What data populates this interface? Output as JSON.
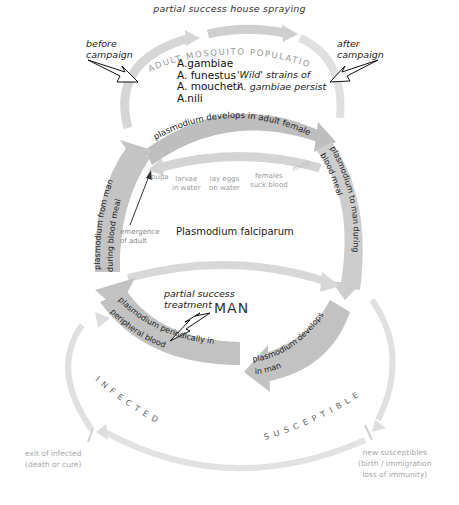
{
  "diagram": {
    "top_label": "partial success house spraying",
    "before_campaign": [
      "before",
      "campaign"
    ],
    "after_campaign": [
      "after",
      "campaign"
    ],
    "mosquito_population_label": "ADULT MOSQUITO POPULATION",
    "species": [
      "A.gambiae",
      "A. funestus",
      "A. moucheti",
      "A.nili"
    ],
    "wild_strains": [
      "'Wild' strains of",
      "A. gambiae persist"
    ],
    "arrow_plasmodium_adult_female": "plasmodium develops in adult female",
    "mosquito_life_cycle": {
      "pupa": "pupa",
      "larvae": [
        "larvae",
        "in water"
      ],
      "lay_eggs": [
        "lay eggs",
        "on water"
      ],
      "females": [
        "females",
        "suck blood"
      ],
      "mate": "mate"
    },
    "emergence": [
      "emergence",
      "of adult"
    ],
    "arrow_from_man": [
      "plasmodium from man",
      "during  blood meal"
    ],
    "arrow_to_man": [
      "plasmodium to man during",
      "blood meal"
    ],
    "center_label": "Plasmodium falciparum",
    "treatment": [
      "partial success",
      "treatment"
    ],
    "man_label": "MAN",
    "arrow_peripheral_blood": [
      "plasmodium periodically in",
      "peripheral blood"
    ],
    "arrow_develops_in_man": [
      "plasmodium develops",
      "in man"
    ],
    "infected_label": "INFECTED",
    "susceptible_label": "SUSCEPTIBLE",
    "exit_infected": [
      "exit of infected",
      "(death or cure)"
    ],
    "new_susceptibles": [
      "new susceptibles",
      "(birth / immigration",
      "loss of immunity)"
    ],
    "colors": {
      "arrow_dark": "#bdbdbd",
      "arrow_light": "#d9d9d9",
      "text_faint": "#a0a0a0",
      "text_main": "#222222"
    }
  }
}
